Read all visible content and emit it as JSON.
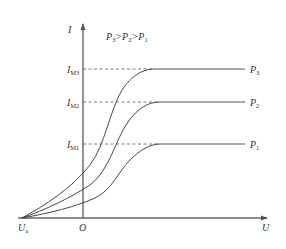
{
  "diagram": {
    "condition": {
      "p": "P",
      "s3": "3",
      "gt1": ">",
      "s2": "2",
      "gt2": ">",
      "s1": "1"
    },
    "y_axis": {
      "label": "I"
    },
    "x_axis": {
      "label": "U",
      "origin": "O",
      "stop_voltage": {
        "main": "U",
        "sub": "a"
      }
    },
    "levels": [
      {
        "main": "I",
        "sub": "M3",
        "curve_main": "P",
        "curve_sub": "3"
      },
      {
        "main": "I",
        "sub": "M2",
        "curve_main": "P",
        "curve_sub": "2"
      },
      {
        "main": "I",
        "sub": "M1",
        "curve_main": "P",
        "curve_sub": "1"
      }
    ]
  }
}
